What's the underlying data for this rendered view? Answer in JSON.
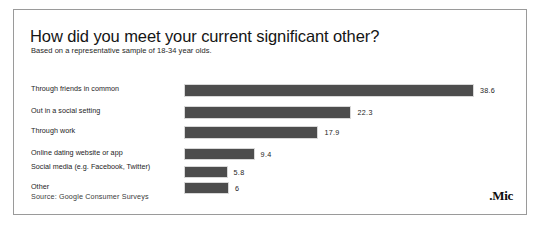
{
  "card": {
    "title": "How did you meet your current significant other?",
    "subtitle": "Based on a representative sample of 18-34 year olds.",
    "source": "Source: Google Consumer Surveys",
    "logo": ".Mic"
  },
  "chart_data": {
    "type": "bar",
    "orientation": "horizontal",
    "title": "How did you meet your current significant other?",
    "subtitle": "Based on a representative sample of 18-34 year olds.",
    "xlabel": "",
    "ylabel": "",
    "xlim": [
      0,
      45
    ],
    "grid": false,
    "legend": false,
    "bar_color": "#4d4d4d",
    "source": "Source: Google Consumer Surveys",
    "categories": [
      "Through friends in common",
      "Out in a social setting",
      "Through work",
      "Online dating website or app",
      "Social media (e.g. Facebook, Twitter)",
      "Other"
    ],
    "values": [
      38.6,
      22.3,
      17.9,
      9.4,
      5.8,
      6
    ],
    "value_labels": [
      "38.6",
      "22.3",
      "17.9",
      "9.4",
      "5.8",
      "6"
    ]
  }
}
